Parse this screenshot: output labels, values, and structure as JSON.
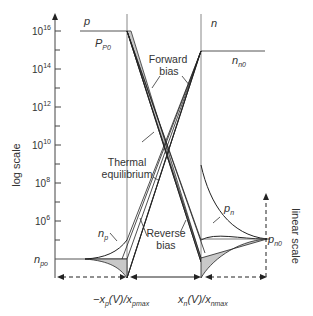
{
  "diagram": {
    "y_axis_label": "log scale",
    "right_axis_label": "linear scale",
    "y_ticks": [
      {
        "base": "10",
        "exp": "16"
      },
      {
        "base": "10",
        "exp": "14"
      },
      {
        "base": "10",
        "exp": "12"
      },
      {
        "base": "10",
        "exp": "10"
      },
      {
        "base": "10",
        "exp": "8"
      },
      {
        "base": "10",
        "exp": "6"
      }
    ],
    "region_labels": {
      "p_side": "p",
      "n_side": "n"
    },
    "carrier_labels": {
      "pp0_main": "P",
      "pp0_sub": "P0",
      "nn0_main": "n",
      "nn0_sub": "n0",
      "np_main": "n",
      "np_sub": "p",
      "pn_main": "p",
      "pn_sub": "n",
      "npo_main": "n",
      "npo_sub": "po",
      "pn0_main": "p",
      "pn0_sub": "n0"
    },
    "annotations": {
      "forward_line1": "Forward",
      "forward_line2": "bias",
      "thermal_line1": "Thermal",
      "thermal_line2": "equilibrium",
      "reverse_line1": "Reverse",
      "reverse_line2": "bias"
    },
    "x_labels": {
      "left_pre": "−x",
      "left_sub": "p",
      "left_mid": "(V)/x",
      "left_sub2": "pmax",
      "right_pre": "x",
      "right_sub": "n",
      "right_mid": "(V)/x",
      "right_sub2": "nmax"
    },
    "colors": {
      "line": "#333333",
      "fill": "#c8c8c8",
      "guide": "#888888"
    }
  }
}
